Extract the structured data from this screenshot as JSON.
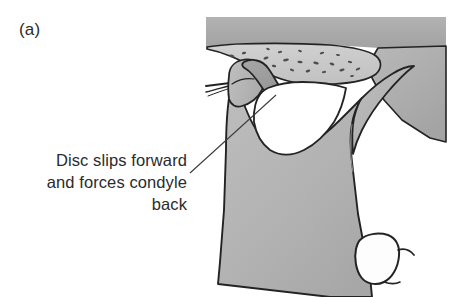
{
  "figure": {
    "panel_label": "(a)",
    "caption_lines": [
      "Disc slips forward",
      "and forces condyle",
      "back"
    ],
    "caption_full": "Disc slips forward and forces condyle back",
    "background_color": "#ffffff"
  },
  "illustration": {
    "type": "medical-line-drawing",
    "region": {
      "x": 206,
      "y": 17,
      "width": 239,
      "height": 280
    },
    "colors": {
      "skull_band": "#a9a9a9",
      "temporal_bone": "#c9c9c9",
      "mandible": "#b0b0b0",
      "disc": "#9a9a9a",
      "condyle": "#b4b4b4",
      "joint_space": "#ffffff",
      "tooth": "#fdfdfd",
      "outline": "#232323",
      "speckle": "#4a4a4a",
      "leader_line": "#3b3b3b"
    },
    "parts": [
      {
        "name": "cranial-base-band",
        "label": "cranial base"
      },
      {
        "name": "temporal-bone",
        "label": "temporal bone / glenoid fossa"
      },
      {
        "name": "articular-eminence",
        "label": "articular eminence"
      },
      {
        "name": "articular-disc",
        "label": "articular disc (displaced anteriorly)"
      },
      {
        "name": "mandibular-condyle",
        "label": "mandibular condyle"
      },
      {
        "name": "mandibular-ramus",
        "label": "ramus of mandible"
      },
      {
        "name": "coronoid-process",
        "label": "coronoid process"
      },
      {
        "name": "sigmoid-notch",
        "label": "sigmoid notch"
      },
      {
        "name": "retrodiscal-tissue",
        "label": "retrodiscal tissue"
      },
      {
        "name": "molar-tooth",
        "label": "molar tooth"
      }
    ],
    "leader_line": {
      "from_x": 190,
      "from_y": 173,
      "to_x": 276,
      "to_y": 95
    }
  }
}
